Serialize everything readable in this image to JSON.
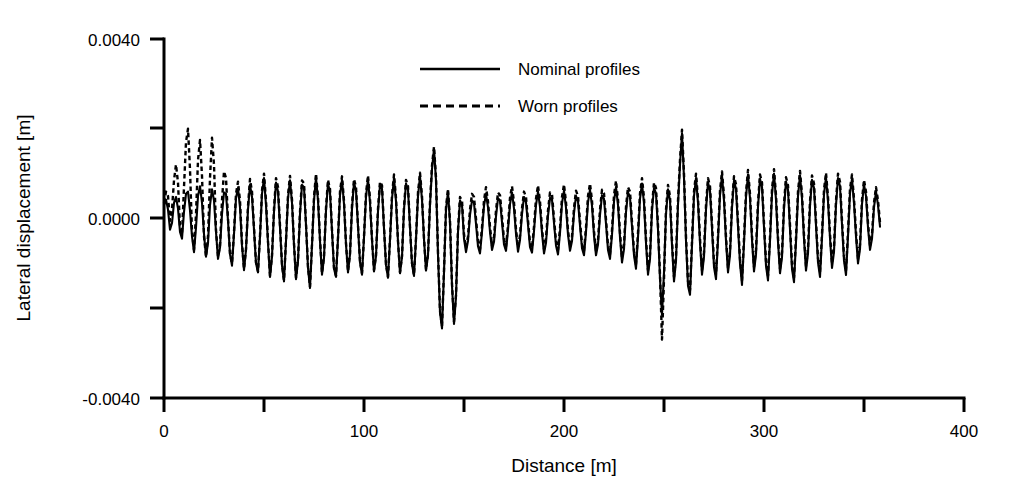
{
  "chart_data": {
    "type": "line",
    "title": "",
    "xlabel": "Distance [m]",
    "ylabel": "Lateral displacement [m]",
    "xlim": [
      0,
      400
    ],
    "ylim": [
      -0.004,
      0.004
    ],
    "xticks": [
      0,
      50,
      100,
      150,
      200,
      250,
      300,
      350,
      400
    ],
    "xtick_labels": [
      "0",
      "",
      "100",
      "",
      "200",
      "",
      "300",
      "",
      "400"
    ],
    "yticks": [
      -0.004,
      -0.002,
      0.0,
      0.002,
      0.004
    ],
    "ytick_labels": [
      "-0.0040",
      "",
      "0.0000",
      "",
      "0.0040"
    ],
    "grid": false,
    "legend_position": "top-center",
    "x_sampling_step_m": 1.0,
    "data_x_range": [
      0,
      350
    ],
    "series": [
      {
        "name": "Nominal profiles",
        "style": "solid",
        "color": "#000000",
        "values": [
          0.0003,
          0.00042,
          0.0002,
          -0.00025,
          -0.0001,
          0.00035,
          0.00048,
          0.00022,
          -0.0003,
          -0.00045,
          0.00015,
          0.00055,
          0.0006,
          0.00018,
          -0.0004,
          -0.00075,
          -0.0002,
          0.0005,
          0.00072,
          0.00035,
          -0.00035,
          -0.00085,
          -0.00055,
          0.0003,
          0.00065,
          0.0004,
          -0.0003,
          -0.0009,
          -0.00065,
          0.0001,
          0.00058,
          0.00055,
          -5e-05,
          -0.0008,
          -0.00105,
          -0.00035,
          0.00045,
          0.00068,
          0.00025,
          -0.0006,
          -0.00115,
          -0.0007,
          0.0002,
          0.00075,
          0.00048,
          -0.00025,
          -0.001,
          -0.0012,
          -0.0004,
          0.00055,
          0.0009,
          0.0003,
          -0.00055,
          -0.0013,
          -0.00085,
          0.00015,
          0.0008,
          0.0006,
          -0.0002,
          -0.00105,
          -0.0014,
          -0.0005,
          0.00045,
          0.00085,
          0.00035,
          -0.0006,
          -0.00135,
          -0.00095,
          0.0001,
          0.00075,
          0.0007,
          -0.00015,
          -0.0011,
          -0.00155,
          -0.0006,
          0.0004,
          0.00092,
          0.0004,
          -0.0005,
          -0.00125,
          -0.00088,
          0.00018,
          0.00078,
          0.00058,
          -0.00028,
          -0.00112,
          -0.0013,
          -0.00045,
          0.00052,
          0.00086,
          0.00032,
          -0.00058,
          -0.0012,
          -0.0008,
          0.00022,
          0.0008,
          0.00062,
          -0.00018,
          -0.00098,
          -0.00125,
          -0.00042,
          0.00048,
          0.00088,
          0.00036,
          -0.00048,
          -0.00118,
          -0.00084,
          0.00016,
          0.00074,
          0.00066,
          -0.00022,
          -0.00104,
          -0.00132,
          -0.00048,
          0.00044,
          0.0009,
          0.00038,
          -0.00052,
          -0.00122,
          -0.00086,
          0.0002,
          0.00078,
          0.00064,
          -0.0002,
          -0.00102,
          -0.00128,
          -0.00046,
          0.0005,
          0.00094,
          0.00042,
          -0.00046,
          -0.00116,
          -0.00082,
          0.0003,
          0.0011,
          0.00155,
          0.00085,
          -0.0008,
          -0.0021,
          -0.00245,
          -0.0012,
          0.0002,
          0.0006,
          -0.0001,
          -0.0015,
          -0.00235,
          -0.00175,
          -0.0003,
          0.0004,
          0.0003,
          -0.00045,
          -0.00075,
          -0.0005,
          8e-05,
          0.0004,
          0.00035,
          -0.00012,
          -0.00062,
          -0.00078,
          -0.0003,
          0.00028,
          0.00055,
          0.00025,
          -0.0003,
          -0.0007,
          -0.00052,
          5e-05,
          0.00045,
          0.0004,
          -8e-05,
          -0.00058,
          -0.00072,
          -0.00026,
          0.00032,
          0.00058,
          0.00022,
          -0.00034,
          -0.00074,
          -0.00048,
          0.0001,
          0.00048,
          0.00036,
          -0.00014,
          -0.00064,
          -0.00076,
          -0.00028,
          0.0003,
          0.0006,
          0.00026,
          -0.00032,
          -0.00078,
          -0.00054,
          6e-05,
          0.00046,
          0.00042,
          -0.0001,
          -0.0006,
          -0.0008,
          -0.00032,
          0.00034,
          0.00062,
          0.00024,
          -0.00036,
          -0.00072,
          -0.0005,
          0.00012,
          0.0005,
          0.00038,
          -0.00016,
          -0.00066,
          -0.00082,
          -0.0003,
          0.00036,
          0.00064,
          0.00028,
          -0.00038,
          -0.00082,
          -0.00058,
          8e-05,
          0.00052,
          0.00044,
          -0.00012,
          -0.0007,
          -0.0009,
          -0.00036,
          0.00038,
          0.0007,
          0.0003,
          -0.00042,
          -0.00098,
          -0.00068,
          0.00014,
          0.00058,
          0.00048,
          -0.00018,
          -0.00082,
          -0.00112,
          -0.00042,
          0.00044,
          0.00078,
          0.00034,
          -0.00055,
          -0.00125,
          -0.0009,
          0.00018,
          0.00068,
          0.00056,
          -0.00025,
          -0.00135,
          -0.00215,
          -0.0012,
          0.0001,
          0.00065,
          0.0004,
          -0.0006,
          -0.0014,
          -0.00095,
          0.0003,
          0.0012,
          0.0019,
          0.0009,
          -0.0005,
          -0.0015,
          -0.0017,
          -0.0006,
          0.0005,
          0.0009,
          0.00035,
          -0.00055,
          -0.00125,
          -0.00085,
          0.0002,
          0.0008,
          0.00062,
          -0.00022,
          -0.00108,
          -0.00135,
          -0.00048,
          0.00052,
          0.00095,
          0.0004,
          -0.0005,
          -0.0012,
          -0.00082,
          0.00024,
          0.00084,
          0.00066,
          -0.00018,
          -0.001,
          -0.00148,
          -0.00055,
          0.00048,
          0.00098,
          0.00045,
          -0.00048,
          -0.00118,
          -0.0008,
          0.00026,
          0.00088,
          0.0007,
          -0.0002,
          -0.00105,
          -0.00138,
          -0.0005,
          0.00055,
          0.001,
          0.00042,
          -0.00052,
          -0.00122,
          -0.00086,
          0.00022,
          0.00082,
          0.00064,
          -0.00024,
          -0.00112,
          -0.00142,
          -0.00052,
          0.0005,
          0.00096,
          0.00044,
          -0.00046,
          -0.00116,
          -0.00078,
          0.00028,
          0.00086,
          0.00068,
          -0.00016,
          -0.00098,
          -0.0013,
          -0.00044,
          0.00054,
          0.00092,
          0.00038,
          -0.00044,
          -0.0011,
          -0.00074,
          0.0003,
          0.0009,
          0.00072,
          -0.00014,
          -0.00094,
          -0.00126,
          -0.0004,
          0.00056,
          0.00088,
          0.00034,
          -0.0004,
          -0.001,
          -0.00068,
          0.00032,
          0.00076,
          0.0005,
          -0.0002,
          -0.0007,
          -0.00045,
          0.00025,
          0.0006,
          0.0003,
          -0.00018
        ]
      },
      {
        "name": "Worn profiles",
        "style": "dashed",
        "color": "#000000",
        "values": [
          0.00035,
          0.0006,
          0.0005,
          -5e-05,
          0.0002,
          0.00085,
          0.0012,
          0.0008,
          -0.0002,
          -0.00035,
          0.0007,
          0.0017,
          0.002,
          0.0011,
          -0.0003,
          -0.0007,
          0.0001,
          0.0013,
          0.00175,
          0.00095,
          -0.0004,
          -0.00085,
          -0.0004,
          0.0009,
          0.0018,
          0.0012,
          -0.00025,
          -0.00085,
          -0.0006,
          0.0004,
          0.00105,
          0.0009,
          0.0,
          -0.00078,
          -0.001,
          -0.0003,
          0.00055,
          0.00082,
          0.0004,
          -0.00055,
          -0.00112,
          -0.00068,
          0.00028,
          0.00088,
          0.0006,
          -0.0002,
          -0.00098,
          -0.00118,
          -0.00038,
          0.00062,
          0.001,
          0.0004,
          -0.0005,
          -0.00128,
          -0.00082,
          0.00022,
          0.0009,
          0.0007,
          -0.00015,
          -0.00102,
          -0.00138,
          -0.00048,
          0.00052,
          0.00095,
          0.00042,
          -0.00055,
          -0.00132,
          -0.00092,
          0.00015,
          0.00085,
          0.00078,
          -0.00012,
          -0.00108,
          -0.00152,
          -0.00058,
          0.00048,
          0.001,
          0.00048,
          -0.00046,
          -0.00122,
          -0.00085,
          0.00024,
          0.00086,
          0.00066,
          -0.00025,
          -0.0011,
          -0.00128,
          -0.00042,
          0.0006,
          0.00094,
          0.0004,
          -0.00055,
          -0.00118,
          -0.00078,
          0.0003,
          0.00088,
          0.0007,
          -0.00015,
          -0.00095,
          -0.00122,
          -0.0004,
          0.00056,
          0.00096,
          0.00044,
          -0.00045,
          -0.00115,
          -0.00082,
          0.00022,
          0.00082,
          0.00074,
          -0.0002,
          -0.00102,
          -0.0013,
          -0.00046,
          0.00052,
          0.00098,
          0.00046,
          -0.0005,
          -0.0012,
          -0.00084,
          0.00026,
          0.00086,
          0.00072,
          -0.00018,
          -0.001,
          -0.00126,
          -0.00044,
          0.00058,
          0.00102,
          0.0005,
          -0.00044,
          -0.00114,
          -0.0008,
          0.00036,
          0.00118,
          0.0016,
          0.00092,
          -0.00075,
          -0.00205,
          -0.0024,
          -0.00115,
          0.00025,
          0.00066,
          -5e-05,
          -0.00145,
          -0.0023,
          -0.0017,
          -0.00025,
          0.00048,
          0.0004,
          -0.00035,
          -0.00065,
          -0.0004,
          0.0002,
          0.00055,
          0.00048,
          0.0,
          -0.0005,
          -0.00068,
          -0.0002,
          0.0004,
          0.0007,
          0.00038,
          -0.00018,
          -0.0006,
          -0.00042,
          0.00018,
          0.00058,
          0.00052,
          4e-05,
          -0.00046,
          -0.00062,
          -0.00016,
          0.00046,
          0.00072,
          0.00036,
          -0.00024,
          -0.00064,
          -0.00038,
          0.00022,
          0.0006,
          0.00048,
          -4e-05,
          -0.00054,
          -0.00066,
          -0.00018,
          0.00044,
          0.00074,
          0.00038,
          -0.00022,
          -0.00068,
          -0.00044,
          0.00018,
          0.00058,
          0.00054,
          0.0,
          -0.0005,
          -0.0007,
          -0.00022,
          0.00048,
          0.00076,
          0.00036,
          -0.00026,
          -0.00062,
          -0.0004,
          0.00024,
          0.00062,
          0.0005,
          -6e-05,
          -0.00056,
          -0.00072,
          -0.0002,
          0.0005,
          0.00078,
          0.0004,
          -0.00028,
          -0.00072,
          -0.00048,
          0.0002,
          0.00064,
          0.00056,
          -2e-05,
          -0.0006,
          -0.0008,
          -0.00026,
          0.00052,
          0.00084,
          0.00042,
          -0.00032,
          -0.00088,
          -0.00058,
          0.00026,
          0.0007,
          0.0006,
          -8e-05,
          -0.00072,
          -0.00102,
          -0.00032,
          0.00056,
          0.0009,
          0.00046,
          -0.00045,
          -0.00115,
          -0.0008,
          0.00028,
          0.0008,
          0.00068,
          -0.00015,
          -0.00125,
          -0.0027,
          -0.00135,
          0.0002,
          0.00075,
          0.0005,
          -0.0005,
          -0.0013,
          -0.00085,
          0.0004,
          0.0013,
          0.00198,
          0.001,
          -0.0004,
          -0.0014,
          -0.0016,
          -0.0005,
          0.0006,
          0.001,
          0.00045,
          -0.00045,
          -0.00115,
          -0.00075,
          0.0003,
          0.0009,
          0.00072,
          -0.00012,
          -0.00098,
          -0.00125,
          -0.00038,
          0.00062,
          0.00105,
          0.0005,
          -0.0004,
          -0.0011,
          -0.00072,
          0.00034,
          0.00094,
          0.00076,
          -8e-05,
          -0.0009,
          -0.00138,
          -0.00045,
          0.00058,
          0.00108,
          0.00055,
          -0.00038,
          -0.00108,
          -0.0007,
          0.00036,
          0.00098,
          0.0008,
          -0.0001,
          -0.00095,
          -0.00128,
          -0.0004,
          0.00065,
          0.0011,
          0.00052,
          -0.00042,
          -0.00112,
          -0.00076,
          0.00032,
          0.00092,
          0.00074,
          -0.00014,
          -0.00102,
          -0.00132,
          -0.00042,
          0.0006,
          0.00106,
          0.00054,
          -0.00036,
          -0.00106,
          -0.00068,
          0.00038,
          0.00096,
          0.00078,
          -6e-05,
          -0.00088,
          -0.0012,
          -0.00034,
          0.00064,
          0.00102,
          0.00048,
          -0.00034,
          -0.001,
          -0.00064,
          0.0004,
          0.001,
          0.00082,
          -4e-05,
          -0.00084,
          -0.00116,
          -0.0003,
          0.00066,
          0.00098,
          0.00044,
          -0.0003,
          -0.0009,
          -0.00058,
          0.00042,
          0.00086,
          0.0006,
          -0.0001,
          -0.0006,
          -0.00035,
          0.00035,
          0.0007,
          0.0004,
          -8e-05
        ]
      }
    ]
  },
  "legend": {
    "entries": [
      {
        "label": "Nominal profiles",
        "style": "solid"
      },
      {
        "label": "Worn profiles",
        "style": "dashed"
      }
    ]
  },
  "axes": {
    "x_title": "Distance [m]",
    "y_title": "Lateral displacement [m]",
    "x_tick_labels": [
      "0",
      "100",
      "200",
      "300",
      "400"
    ],
    "y_tick_labels": [
      "0.0040",
      "0.0000",
      "-0.0040"
    ]
  }
}
